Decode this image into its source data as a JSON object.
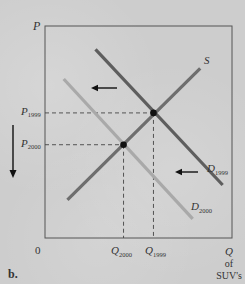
{
  "panel_label": "b.",
  "axes": {
    "y_label": "P",
    "origin_label": "0",
    "x_label_main": "Q",
    "x_label_line2": "of",
    "x_label_line3": "SUV's"
  },
  "curves": {
    "supply": {
      "label": "S",
      "color": "#6e6e6e"
    },
    "demand_1999": {
      "label_main": "D",
      "label_sub": "1999",
      "color": "#5e5e5e"
    },
    "demand_2000": {
      "label_main": "D",
      "label_sub": "2000",
      "color": "#a9a9a9"
    }
  },
  "price_labels": [
    {
      "main": "P",
      "sub": "1999"
    },
    {
      "main": "P",
      "sub": "2000"
    }
  ],
  "quantity_labels": [
    {
      "main": "Q",
      "sub": "2000"
    },
    {
      "main": "Q",
      "sub": "1999"
    }
  ],
  "chart_data": {
    "type": "line",
    "title": "",
    "panel": "b.",
    "xlabel": "Q of SUV's",
    "ylabel": "P",
    "xlim": [
      0,
      10
    ],
    "ylim": [
      0,
      10
    ],
    "series": [
      {
        "name": "S",
        "points": [
          [
            1.2,
            1.8
          ],
          [
            8.3,
            8.0
          ]
        ]
      },
      {
        "name": "D1999",
        "points": [
          [
            2.7,
            8.9
          ],
          [
            9.5,
            2.5
          ]
        ]
      },
      {
        "name": "D2000",
        "points": [
          [
            1.0,
            7.5
          ],
          [
            7.9,
            0.9
          ]
        ]
      }
    ],
    "equilibria": [
      {
        "name": "1999",
        "q_label": "Q1999",
        "p_label": "P1999",
        "q": 5.8,
        "p": 5.9
      },
      {
        "name": "2000",
        "q_label": "Q2000",
        "p_label": "P2000",
        "q": 4.2,
        "p": 4.4
      }
    ],
    "annotations": [
      "Left arrows indicate demand shifting from D1999 to D2000",
      "Down arrow indicates price falling from P1999 to P2000"
    ],
    "grid": false
  }
}
